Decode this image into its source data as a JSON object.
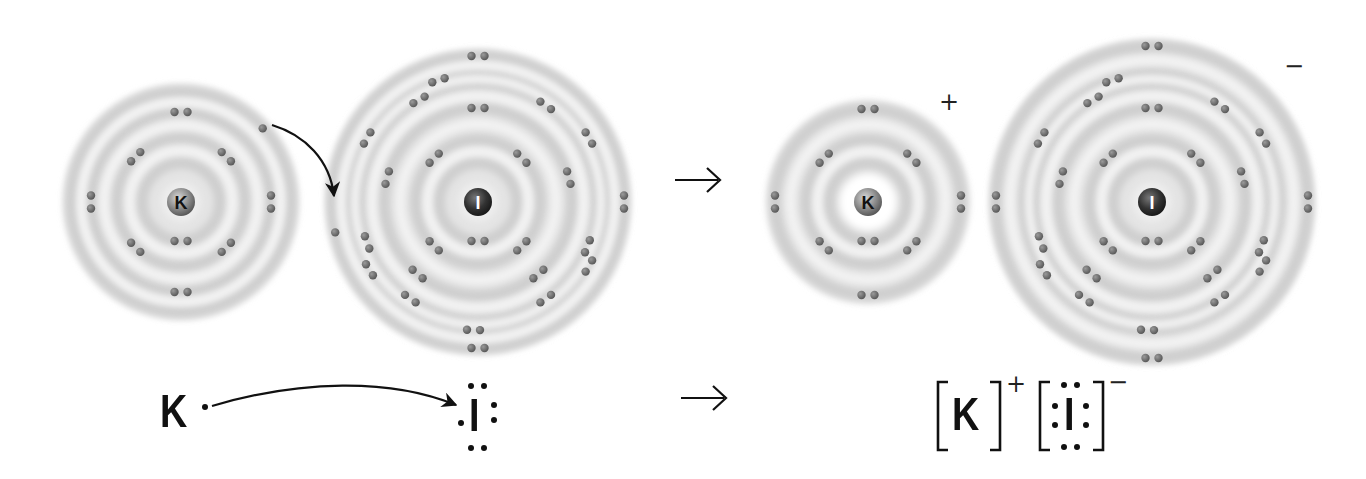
{
  "diagram": {
    "colors": {
      "shell_light": "#f2f2f2",
      "shell_dark": "#d6d6d6",
      "electron": "#6a6a6a",
      "nucleus_K": "#8a8a8a",
      "nucleus_I": "#3a3a3a",
      "ink": "#111111"
    },
    "reaction_arrow_symbol": "→",
    "atoms": [
      {
        "id": "K-atom",
        "symbol": "K",
        "cx": 181,
        "cy": 202,
        "outer_r": 118,
        "nucleus_color": "#8a8a8a",
        "shells": [
          39,
          64,
          90,
          110
        ],
        "electrons": [
          {
            "shell": 0,
            "angle": 180,
            "pair": true
          },
          {
            "shell": 1,
            "angle": -45,
            "pair": true
          },
          {
            "shell": 1,
            "angle": 45,
            "pair": true
          },
          {
            "shell": 1,
            "angle": 135,
            "pair": true
          },
          {
            "shell": 1,
            "angle": -135,
            "pair": true
          },
          {
            "shell": 2,
            "angle": 0,
            "pair": true
          },
          {
            "shell": 2,
            "angle": 90,
            "pair": true
          },
          {
            "shell": 2,
            "angle": 180,
            "pair": true
          },
          {
            "shell": 2,
            "angle": 270,
            "pair": true
          },
          {
            "shell": 3,
            "angle": 48,
            "pair": false
          }
        ]
      },
      {
        "id": "I-atom",
        "symbol": "I",
        "cx": 478,
        "cy": 202,
        "outer_r": 152,
        "nucleus_color": "#3a3a3a",
        "shells": [
          39,
          62,
          94,
          118,
          128,
          146
        ],
        "electrons": [
          {
            "shell": 0,
            "angle": 180,
            "pair": true
          },
          {
            "shell": 1,
            "angle": -45,
            "pair": true
          },
          {
            "shell": 1,
            "angle": 45,
            "pair": true
          },
          {
            "shell": 1,
            "angle": 135,
            "pair": true
          },
          {
            "shell": 1,
            "angle": -135,
            "pair": true
          },
          {
            "shell": 2,
            "angle": 0,
            "pair": true
          },
          {
            "shell": 2,
            "angle": 75,
            "pair": true
          },
          {
            "shell": 2,
            "angle": 140,
            "pair": true
          },
          {
            "shell": 2,
            "angle": 220,
            "pair": true
          },
          {
            "shell": 2,
            "angle": 285,
            "pair": true
          },
          {
            "shell": 3,
            "angle": -30,
            "pair": true
          },
          {
            "shell": 3,
            "angle": 35,
            "pair": true
          },
          {
            "shell": 3,
            "angle": 112,
            "pair": true
          },
          {
            "shell": 3,
            "angle": 145,
            "pair": true
          },
          {
            "shell": 3,
            "angle": 215,
            "pair": true
          },
          {
            "shell": 3,
            "angle": 250,
            "pair": true
          },
          {
            "shell": 4,
            "angle": -18,
            "pair": true
          },
          {
            "shell": 4,
            "angle": 60,
            "pair": true
          },
          {
            "shell": 4,
            "angle": 120,
            "pair": true
          },
          {
            "shell": 4,
            "angle": 182,
            "pair": true
          },
          {
            "shell": 4,
            "angle": 238,
            "pair": true
          },
          {
            "shell": 4,
            "angle": 300,
            "pair": true
          },
          {
            "shell": 5,
            "angle": 0,
            "pair": true
          },
          {
            "shell": 5,
            "angle": 90,
            "pair": true
          },
          {
            "shell": 5,
            "angle": 180,
            "pair": true
          },
          {
            "shell": 5,
            "angle": 258,
            "pair": false
          }
        ]
      },
      {
        "id": "K-ion",
        "symbol": "K",
        "cx": 868,
        "cy": 202,
        "outer_r": 102,
        "nucleus_color": "#8a8a8a",
        "bright_center": true,
        "charge": "+",
        "charge_x": 948,
        "charge_y": 95,
        "shells": [
          39,
          62,
          93
        ],
        "electrons": [
          {
            "shell": 0,
            "angle": 180,
            "pair": true
          },
          {
            "shell": 1,
            "angle": -45,
            "pair": true
          },
          {
            "shell": 1,
            "angle": 45,
            "pair": true
          },
          {
            "shell": 1,
            "angle": 135,
            "pair": true
          },
          {
            "shell": 1,
            "angle": -135,
            "pair": true
          },
          {
            "shell": 2,
            "angle": 0,
            "pair": true
          },
          {
            "shell": 2,
            "angle": 90,
            "pair": true
          },
          {
            "shell": 2,
            "angle": 180,
            "pair": true
          },
          {
            "shell": 2,
            "angle": 270,
            "pair": true
          }
        ]
      },
      {
        "id": "I-ion",
        "symbol": "I",
        "cx": 1152,
        "cy": 202,
        "outer_r": 162,
        "nucleus_color": "#3a3a3a",
        "charge": "−",
        "charge_x": 1292,
        "charge_y": 60,
        "shells": [
          39,
          62,
          94,
          118,
          128,
          156
        ],
        "electrons": [
          {
            "shell": 0,
            "angle": 180,
            "pair": true
          },
          {
            "shell": 1,
            "angle": -45,
            "pair": true
          },
          {
            "shell": 1,
            "angle": 45,
            "pair": true
          },
          {
            "shell": 1,
            "angle": 135,
            "pair": true
          },
          {
            "shell": 1,
            "angle": -135,
            "pair": true
          },
          {
            "shell": 2,
            "angle": 0,
            "pair": true
          },
          {
            "shell": 2,
            "angle": 75,
            "pair": true
          },
          {
            "shell": 2,
            "angle": 140,
            "pair": true
          },
          {
            "shell": 2,
            "angle": 220,
            "pair": true
          },
          {
            "shell": 2,
            "angle": 285,
            "pair": true
          },
          {
            "shell": 3,
            "angle": -30,
            "pair": true
          },
          {
            "shell": 3,
            "angle": 35,
            "pair": true
          },
          {
            "shell": 3,
            "angle": 112,
            "pair": true
          },
          {
            "shell": 3,
            "angle": 145,
            "pair": true
          },
          {
            "shell": 3,
            "angle": 215,
            "pair": true
          },
          {
            "shell": 3,
            "angle": 250,
            "pair": true
          },
          {
            "shell": 4,
            "angle": -18,
            "pair": true
          },
          {
            "shell": 4,
            "angle": 60,
            "pair": true
          },
          {
            "shell": 4,
            "angle": 120,
            "pair": true
          },
          {
            "shell": 4,
            "angle": 182,
            "pair": true
          },
          {
            "shell": 4,
            "angle": 238,
            "pair": true
          },
          {
            "shell": 4,
            "angle": 300,
            "pair": true
          },
          {
            "shell": 5,
            "angle": 0,
            "pair": true
          },
          {
            "shell": 5,
            "angle": 90,
            "pair": true
          },
          {
            "shell": 5,
            "angle": 180,
            "pair": true
          },
          {
            "shell": 5,
            "angle": 270,
            "pair": true
          }
        ]
      }
    ],
    "lewis": {
      "reactants": {
        "K_symbol": "K",
        "I_symbol": "I"
      },
      "products": {
        "K_symbol": "K",
        "K_charge": "+",
        "I_symbol": "I",
        "I_charge": "−",
        "open_bracket": "[",
        "close_bracket": "]"
      }
    }
  }
}
